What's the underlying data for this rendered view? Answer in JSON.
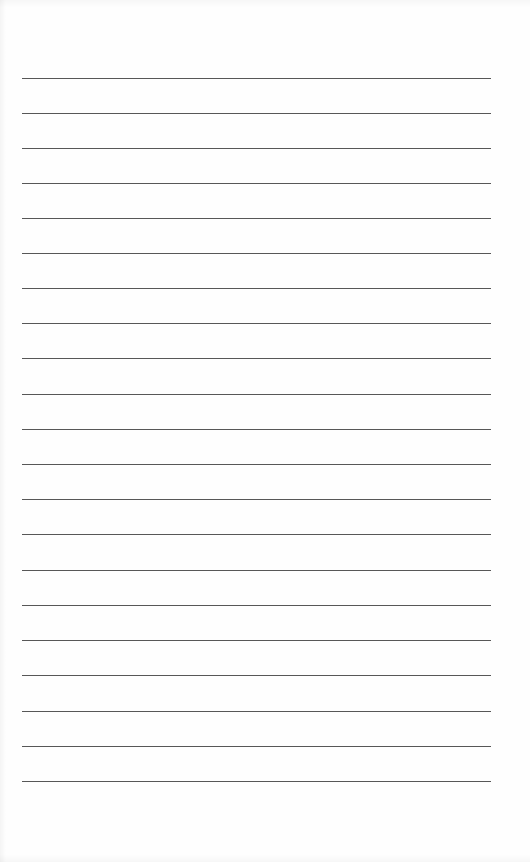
{
  "document": {
    "type": "lined-paper",
    "line_count": 21,
    "line_color": "#3a3a3a",
    "background_color": "#fefefe",
    "lines_y": [
      78,
      113,
      148,
      183,
      218,
      253,
      288,
      323,
      358,
      394,
      429,
      464,
      499,
      534,
      570,
      605,
      640,
      675,
      711,
      746,
      781
    ],
    "line_left": 22,
    "line_width": 469
  }
}
